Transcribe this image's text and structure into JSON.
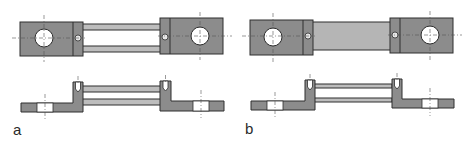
{
  "figure": {
    "panels": [
      {
        "id": "a",
        "label": "a",
        "variant": "two-rod connector"
      },
      {
        "id": "b",
        "label": "b",
        "variant": "solid-bar connector"
      }
    ]
  },
  "colors": {
    "block_fill": "#8c8c8c",
    "rod_fill": "#bdbdbd",
    "bar_fill": "#b5b5b5",
    "outline": "#2e2e2e",
    "hole_fill": "#ffffff",
    "centerline": "#555555"
  }
}
